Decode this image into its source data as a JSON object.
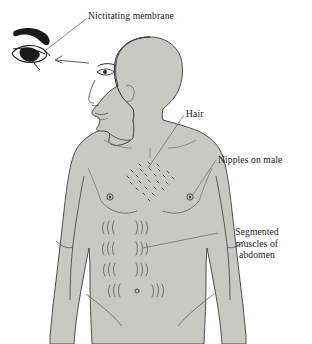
{
  "diagram": {
    "background_color": "#ffffff",
    "body_fill_color": "#c9c9c4",
    "outline_color": "#3b3b3b",
    "detail_line_color": "#5a5a5a",
    "leader_line_color": "#6e6e6e",
    "text_color": "#1a1a1a"
  },
  "labels": {
    "nictitating_membrane": "Nictitating membrane",
    "hair": "Hair",
    "nipples_on_male": "Nipples on male",
    "segmented_muscles_line1": "Segmented",
    "segmented_muscles_line2": "muscles of",
    "segmented_muscles_line3": "abdomen"
  },
  "features": {
    "eye_inset": "enlarged-eye-with-nictitating-membrane",
    "arrow_direction": "points-left-from-face-eye-to-inset",
    "chest_hair_cluster": "diamond-shaped-cluster-of-short-dashes",
    "nipple_count": 2,
    "abdominal_segment_rows": 4,
    "navel": "small-circle-in-bottom-abdominal-row"
  }
}
